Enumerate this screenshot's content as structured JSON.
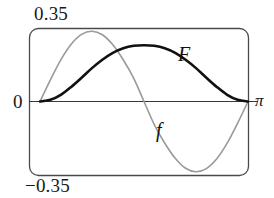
{
  "chart_data": {
    "type": "line",
    "title": "",
    "subtitle": "",
    "xlabel": "",
    "ylabel": "",
    "xlim": [
      0,
      3.14159
    ],
    "ylim": [
      -0.35,
      0.35
    ],
    "grid": false,
    "legend_position": "inline-annotation",
    "x_tick_labels": [
      "0",
      "π"
    ],
    "y_tick_labels": [
      "0.35",
      "0",
      "−0.35"
    ],
    "annotations": [
      {
        "text": "F",
        "x": 2.05,
        "y": 0.125,
        "series": "F"
      },
      {
        "text": "f",
        "x": 1.75,
        "y": -0.095,
        "series": "f"
      }
    ],
    "x": [
      0.0,
      0.157,
      0.314,
      0.471,
      0.628,
      0.785,
      0.942,
      1.1,
      1.257,
      1.414,
      1.571,
      1.728,
      1.885,
      2.042,
      2.199,
      2.356,
      2.513,
      2.67,
      2.827,
      2.985,
      3.142
    ],
    "series": [
      {
        "name": "f",
        "color": "#9a9a9a",
        "width": 1.6,
        "values": [
          0.0,
          0.104,
          0.2,
          0.275,
          0.322,
          0.337,
          0.32,
          0.272,
          0.2,
          0.112,
          0.0,
          -0.112,
          -0.2,
          -0.272,
          -0.32,
          -0.337,
          -0.322,
          -0.275,
          -0.2,
          -0.104,
          0.0
        ]
      },
      {
        "name": "F",
        "color": "#111111",
        "width": 2.6,
        "values": [
          0.0,
          0.008,
          0.032,
          0.07,
          0.114,
          0.16,
          0.2,
          0.233,
          0.255,
          0.267,
          0.27,
          0.267,
          0.255,
          0.233,
          0.2,
          0.16,
          0.114,
          0.07,
          0.032,
          0.008,
          0.0
        ]
      }
    ]
  },
  "axes": {
    "ymax_label": "0.35",
    "ymin_label": "−0.35",
    "zero_label": "0",
    "xmax_label": "π"
  },
  "series_labels": {
    "F": "F",
    "f": "f"
  }
}
